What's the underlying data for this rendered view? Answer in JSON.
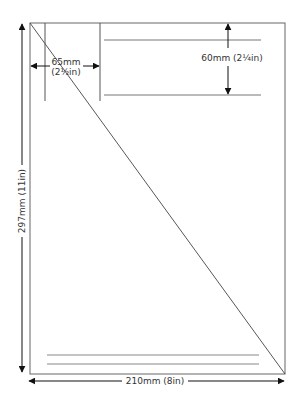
{
  "diagram": {
    "type": "page-layout-dimensions",
    "page": {
      "width_label": "210mm (8in)",
      "height_label": "297mm (11in)"
    },
    "margins": {
      "left": {
        "label_line1": "65mm",
        "label_line2": "(2½in)"
      },
      "top_block": {
        "label": "60mm (2¼in)"
      }
    },
    "colors": {
      "line": "#555555",
      "text": "#333333",
      "background": "#ffffff"
    }
  }
}
